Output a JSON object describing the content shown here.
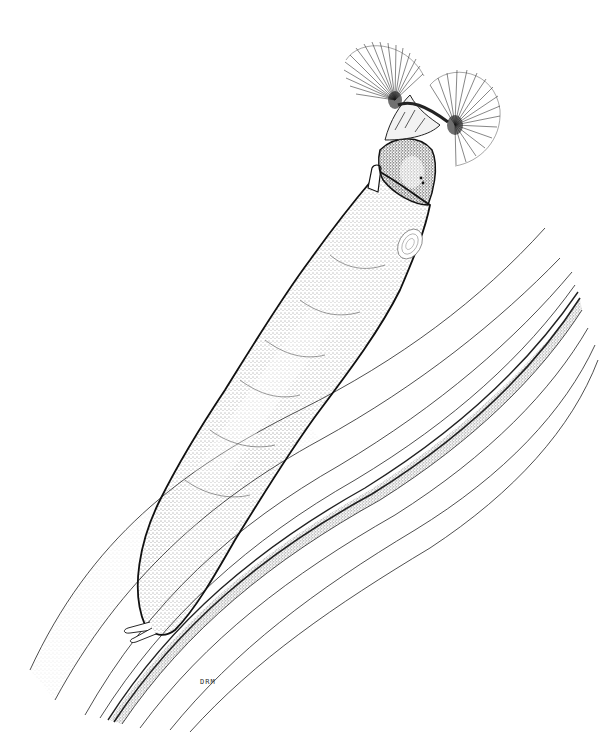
{
  "illustration": {
    "subject": "black fly larva attached to plant stem",
    "style": "pen-and-ink stipple",
    "background_color": "#ffffff",
    "ink_color": "#111111",
    "signature": "DRM"
  }
}
